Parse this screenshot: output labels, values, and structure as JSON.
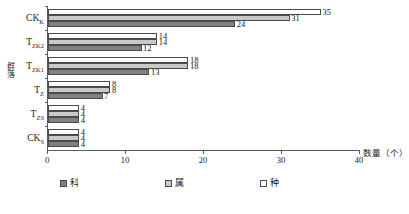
{
  "chart_data": {
    "type": "bar",
    "orientation": "horizontal",
    "title": "",
    "xlabel": "数量（个）",
    "ylabel": "群落",
    "categories": [
      "CKₖ",
      "Tᴢₖ₂",
      "Tᴢₖ₁",
      "Tᴢ",
      "Tᴢₛ",
      "CKₛ"
    ],
    "categories_display": [
      {
        "base": "CK",
        "sub": "K"
      },
      {
        "base": "T",
        "sub": "ZK2"
      },
      {
        "base": "T",
        "sub": "ZK1"
      },
      {
        "base": "T",
        "sub": "Z"
      },
      {
        "base": "T",
        "sub": "ZS"
      },
      {
        "base": "CK",
        "sub": "S"
      }
    ],
    "series": [
      {
        "name": "科",
        "color": "#808080",
        "values": [
          24,
          12,
          13,
          7,
          4,
          4
        ]
      },
      {
        "name": "属",
        "color": "#c8c8c8",
        "values": [
          31,
          14,
          18,
          8,
          4,
          4
        ]
      },
      {
        "name": "种",
        "color": "#ffffff",
        "values": [
          35,
          14,
          18,
          8,
          4,
          4
        ]
      }
    ],
    "xlim": [
      0,
      40
    ],
    "xticks": [
      0,
      10,
      20,
      30,
      40
    ],
    "xtick_labels": [
      "0",
      "10",
      "20",
      "30",
      "40"
    ],
    "grid": false,
    "legend_position": "bottom",
    "legend": [
      "科",
      "属",
      "种"
    ]
  },
  "axes": {
    "y_title": "群落",
    "x_title": "数量（个）"
  }
}
